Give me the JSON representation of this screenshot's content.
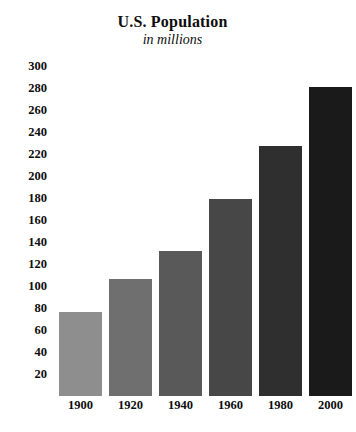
{
  "chart_data": {
    "type": "bar",
    "title": "U.S. Population",
    "subtitle": "in millions",
    "xlabel": "",
    "ylabel": "",
    "grid": false,
    "legend": "none",
    "categories": [
      "1900",
      "1920",
      "1940",
      "1960",
      "1980",
      "2000"
    ],
    "values": [
      76,
      106,
      132,
      179,
      227,
      281
    ],
    "ylim": [
      0,
      300
    ],
    "yticks": [
      300,
      280,
      260,
      240,
      220,
      200,
      180,
      160,
      140,
      120,
      100,
      80,
      60,
      40,
      20
    ],
    "ytick_labels": [
      "300",
      "280",
      "260",
      "240",
      "220",
      "200",
      "180",
      "160",
      "140",
      "120",
      "100",
      "80",
      "60",
      "40",
      "20"
    ],
    "bar_colors": [
      "#8e8e8e",
      "#6f6f6f",
      "#595959",
      "#474747",
      "#2f2f2f",
      "#1a1a1a"
    ],
    "bars": [
      {
        "category": "1900",
        "value": 76,
        "color": "#8e8e8e"
      },
      {
        "category": "1920",
        "value": 106,
        "color": "#6f6f6f"
      },
      {
        "category": "1940",
        "value": 132,
        "color": "#595959"
      },
      {
        "category": "1960",
        "value": 179,
        "color": "#474747"
      },
      {
        "category": "1980",
        "value": 227,
        "color": "#2f2f2f"
      },
      {
        "category": "2000",
        "value": 281,
        "color": "#1a1a1a"
      }
    ]
  }
}
